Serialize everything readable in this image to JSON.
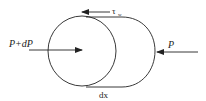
{
  "diagram": {
    "labels": {
      "left_force": "P+dP",
      "right_force": "P",
      "shear": "τ",
      "shear_sub": "w",
      "length": "dx"
    },
    "colors": {
      "stroke": "#222222",
      "background": "#ffffff"
    }
  }
}
